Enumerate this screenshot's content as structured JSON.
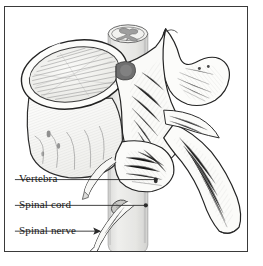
{
  "figure": {
    "kind": "anatomical-line-drawing",
    "frame_color": "#3a3a3a",
    "background_color": "#ffffff",
    "ink_color": "#1a1a1a",
    "bone_fill": "#fcfcfa",
    "shading_color": "#9a9a9a",
    "cord_fill": "#e2e2e0",
    "cord_stroke": "#8d8d8d"
  },
  "labels": [
    {
      "id": "vertebra",
      "text": "Vertebra",
      "leader": {
        "x1": 14,
        "y1": 180,
        "x2": 156,
        "y2": 180,
        "marker": "dot"
      }
    },
    {
      "id": "spinal-cord",
      "text": "Spinal cord",
      "leader": {
        "x1": 14,
        "y1": 206,
        "x2": 146,
        "y2": 206,
        "marker": "dot"
      }
    },
    {
      "id": "spinal-nerve",
      "text": "Spinal nerve",
      "leader": {
        "x1": 14,
        "y1": 232,
        "x2": 101,
        "y2": 232,
        "marker": "arrow"
      }
    }
  ],
  "structures": [
    {
      "name": "vertebral-body",
      "description": "large oval disc, left, with radiating hatch lines"
    },
    {
      "name": "spinal-cord-cylinder",
      "description": "pale translucent vertical cylinder through vertebral foramen"
    },
    {
      "name": "gray-matter-butterfly",
      "description": "H-shaped gray matter on cut top of the cord"
    },
    {
      "name": "superior-articular-process",
      "description": "rounded process, upper right"
    },
    {
      "name": "transverse-process",
      "description": "lateral wing projecting right"
    },
    {
      "name": "spinous-process",
      "description": "long process extending down and to the right"
    },
    {
      "name": "pedicle-lamina",
      "description": "arch forming the vertebral foramen"
    },
    {
      "name": "spinal-nerve-root",
      "description": "nerve branch exiting laterally, lower center"
    },
    {
      "name": "dorsal-root-ganglion",
      "description": "small swelling on the exiting nerve"
    }
  ]
}
